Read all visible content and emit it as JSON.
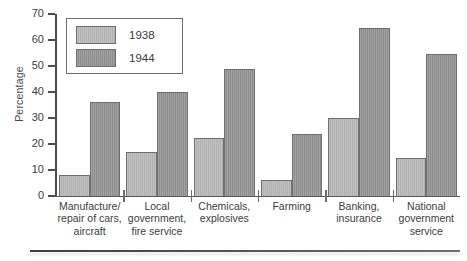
{
  "chart_data": {
    "type": "bar",
    "title": "",
    "xlabel": "",
    "ylabel": "Percentage",
    "ylim": [
      0,
      70
    ],
    "yticks": [
      0,
      10,
      20,
      30,
      40,
      50,
      60,
      70
    ],
    "grid": false,
    "legend_position": "top-left",
    "categories": [
      "Manufacture/\nrepair of cars,\naircraft",
      "Local\ngovernment,\nfire service",
      "Chemicals,\nexplosives",
      "Farming",
      "Banking,\ninsurance",
      "National\ngovernment\nservice"
    ],
    "series": [
      {
        "name": "1938",
        "color": "#b6b6b6",
        "values": [
          8,
          17,
          22.5,
          6,
          30,
          14.5
        ]
      },
      {
        "name": "1944",
        "color": "#949494",
        "values": [
          36,
          40,
          49,
          24,
          64.5,
          54.5
        ]
      }
    ]
  },
  "legend": {
    "items": [
      {
        "label": "1938"
      },
      {
        "label": "1944"
      }
    ]
  },
  "axis": {
    "y_title": "Percentage",
    "tick_labels": [
      "70",
      "60",
      "50",
      "40",
      "30",
      "20",
      "10",
      "0"
    ]
  }
}
